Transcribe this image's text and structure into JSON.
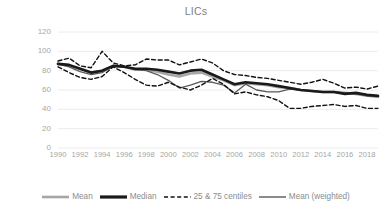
{
  "chart_data": {
    "type": "line",
    "title": "LICs",
    "xlabel": "",
    "ylabel": "",
    "ylim": [
      0,
      120
    ],
    "xlim": [
      1990,
      2019
    ],
    "grid": true,
    "legend_position": "bottom",
    "y_ticks": [
      0,
      20,
      40,
      60,
      80,
      100,
      120
    ],
    "x_ticks": [
      1990,
      1992,
      1994,
      1996,
      1998,
      2000,
      2002,
      2004,
      2006,
      2008,
      2010,
      2012,
      2014,
      2016,
      2018
    ],
    "x": [
      1990,
      1991,
      1992,
      1993,
      1994,
      1995,
      1996,
      1997,
      1998,
      1999,
      2000,
      2001,
      2002,
      2003,
      2004,
      2005,
      2006,
      2007,
      2008,
      2009,
      2010,
      2011,
      2012,
      2013,
      2014,
      2015,
      2016,
      2017,
      2018,
      2019
    ],
    "series": [
      {
        "name": "Mean",
        "style": "solid",
        "color": "#a6a6a6",
        "width": 2.6,
        "values": [
          87,
          85,
          82,
          78,
          80,
          85,
          84,
          81,
          81,
          79,
          76,
          74,
          77,
          78,
          74,
          70,
          65,
          67,
          66,
          65,
          63,
          62,
          60,
          59,
          58,
          58,
          57,
          56,
          54,
          53
        ]
      },
      {
        "name": "Median",
        "style": "solid",
        "color": "#1a1a1a",
        "width": 2.6,
        "values": [
          87,
          86,
          82,
          78,
          80,
          85,
          84,
          82,
          82,
          81,
          79,
          77,
          80,
          81,
          76,
          71,
          66,
          68,
          67,
          66,
          64,
          62,
          60,
          59,
          58,
          58,
          56,
          57,
          55,
          54
        ]
      },
      {
        "name": "25 & 75 centiles",
        "style": "dashed",
        "color": "#111111",
        "width": 1.4,
        "sub_series": [
          {
            "name": "75 centile",
            "values": [
              90,
              93,
              85,
              83,
              100,
              88,
              85,
              86,
              92,
              91,
              91,
              86,
              89,
              92,
              88,
              80,
              76,
              75,
              73,
              72,
              70,
              68,
              66,
              68,
              71,
              67,
              62,
              63,
              61,
              64
            ]
          },
          {
            "name": "25 centile",
            "values": [
              84,
              78,
              73,
              71,
              74,
              84,
              78,
              71,
              65,
              64,
              68,
              63,
              60,
              65,
              72,
              66,
              56,
              58,
              55,
              53,
              49,
              41,
              41,
              43,
              44,
              45,
              43,
              44,
              41,
              41
            ]
          }
        ]
      },
      {
        "name": "Mean (weighted)",
        "style": "solid",
        "color": "#5a5a5a",
        "width": 1.3,
        "values": [
          87,
          84,
          79,
          76,
          78,
          85,
          84,
          81,
          80,
          76,
          70,
          62,
          65,
          69,
          68,
          65,
          57,
          66,
          60,
          58,
          58,
          61,
          60,
          59,
          58,
          58,
          57,
          56,
          54,
          53
        ]
      }
    ]
  },
  "legend": {
    "items": [
      {
        "label": "Mean",
        "key": "mean"
      },
      {
        "label": "Median",
        "key": "median"
      },
      {
        "label": "25 & 75 centiles",
        "key": "centiles"
      },
      {
        "label": "Mean (weighted)",
        "key": "mean-weighted"
      }
    ]
  },
  "colors": {
    "mean": "#a6a6a6",
    "median": "#1a1a1a",
    "centiles": "#111111",
    "mean_weighted": "#5a5a5a",
    "axis_text": "#a6a6a6",
    "title_text": "#7f7f7f",
    "gridline": "#ececec",
    "background": "#ffffff"
  }
}
